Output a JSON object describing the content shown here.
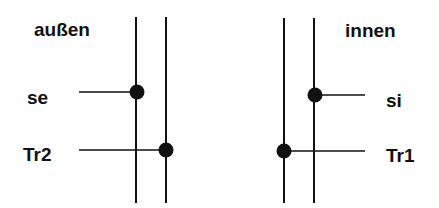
{
  "labels": {
    "outside": "außen",
    "inside": "innen",
    "se": "se",
    "tr2": "Tr2",
    "si": "si",
    "tr1": "Tr1"
  },
  "colors": {
    "line": "#111111",
    "background": "#ffffff"
  }
}
